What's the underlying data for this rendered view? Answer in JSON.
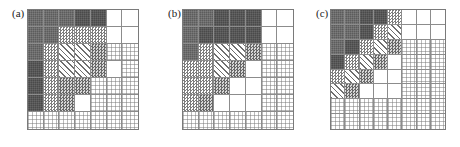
{
  "figure": {
    "type": "matrix-pattern-figure",
    "width": 460,
    "height": 147,
    "background": "#ffffff",
    "panel_count": 3
  },
  "legend_patterns": {
    "dark": "solid dark gray block",
    "darker": "solid darkest gray block",
    "check": "medium checkerboard",
    "checkdark": "dark checkerboard",
    "diag": "diagonal hatch",
    "dot": "light stipple / dotted",
    "white": "empty white"
  },
  "chart_data": {
    "type": "heatmap",
    "title": "",
    "xlabel": "",
    "ylabel": "",
    "grid": true,
    "legend": "none",
    "panels": [
      {
        "label": "(a)",
        "rows": 7,
        "cols": 7,
        "cells": [
          [
            "dark",
            "dark",
            "dark",
            "darker",
            "darker",
            "white",
            "white"
          ],
          [
            "dark",
            "dark",
            "check",
            "check",
            "check",
            "white",
            "white"
          ],
          [
            "dark",
            "check",
            "diag",
            "diag",
            "checkdark",
            "dot",
            "dot"
          ],
          [
            "darker",
            "check",
            "diag",
            "diag",
            "checkdark",
            "white",
            "dot"
          ],
          [
            "darker",
            "check",
            "checkdark",
            "checkdark",
            "dot",
            "dot",
            "dot"
          ],
          [
            "darker",
            "check",
            "checkdark",
            "white",
            "dot",
            "dot",
            "dot"
          ],
          [
            "dot",
            "dot",
            "dot",
            "dot",
            "dot",
            "dot",
            "dot"
          ]
        ]
      },
      {
        "label": "(b)",
        "rows": 7,
        "cols": 7,
        "cells": [
          [
            "dark",
            "dark",
            "darker",
            "darker",
            "darker",
            "white",
            "white"
          ],
          [
            "dark",
            "darker",
            "darker",
            "darker",
            "darker",
            "white",
            "white"
          ],
          [
            "dark",
            "check",
            "diag",
            "diag",
            "checkdark",
            "dot",
            "dot"
          ],
          [
            "check",
            "check",
            "diag",
            "checkdark",
            "white",
            "dot",
            "dot"
          ],
          [
            "check",
            "check",
            "checkdark",
            "white",
            "white",
            "dot",
            "dot"
          ],
          [
            "check",
            "checkdark",
            "white",
            "white",
            "white",
            "dot",
            "dot"
          ],
          [
            "dot",
            "dot",
            "dot",
            "dot",
            "dot",
            "dot",
            "dot"
          ]
        ]
      },
      {
        "label": "(c)",
        "rows": 8,
        "cols": 8,
        "cells": [
          [
            "dark",
            "dark",
            "darker",
            "darker",
            "check",
            "white",
            "white",
            "white"
          ],
          [
            "dark",
            "dark",
            "darker",
            "check",
            "diag",
            "white",
            "white",
            "white"
          ],
          [
            "dark",
            "darker",
            "check",
            "diag",
            "checkdark",
            "dot",
            "dot",
            "dot"
          ],
          [
            "darker",
            "check",
            "diag",
            "checkdark",
            "white",
            "dot",
            "dot",
            "dot"
          ],
          [
            "check",
            "diag",
            "checkdark",
            "white",
            "white",
            "dot",
            "dot",
            "dot"
          ],
          [
            "diag",
            "checkdark",
            "white",
            "white",
            "white",
            "dot",
            "dot",
            "dot"
          ],
          [
            "dot",
            "dot",
            "dot",
            "dot",
            "dot",
            "dot",
            "dot",
            "dot"
          ],
          [
            "dot",
            "dot",
            "dot",
            "dot",
            "dot",
            "dot",
            "dot",
            "dot"
          ]
        ]
      }
    ]
  },
  "panel_geometry": [
    {
      "label_x": 12,
      "label_y": 8,
      "grid_x": 27,
      "grid_y": 9,
      "grid_w": 110,
      "grid_h": 119
    },
    {
      "label_x": 168,
      "label_y": 8,
      "grid_x": 182,
      "grid_y": 9,
      "grid_w": 110,
      "grid_h": 119
    },
    {
      "label_x": 316,
      "label_y": 8,
      "grid_x": 330,
      "grid_y": 9,
      "grid_w": 114,
      "grid_h": 119
    }
  ]
}
